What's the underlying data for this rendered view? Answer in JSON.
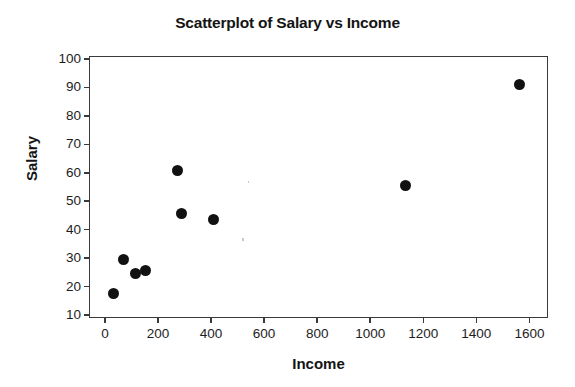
{
  "chart_data": {
    "type": "scatter",
    "title": "Scatterplot of Salary vs Income",
    "xlabel": "Income",
    "ylabel": "Salary",
    "xlim": [
      -60,
      1670
    ],
    "ylim": [
      9,
      101
    ],
    "xticks": [
      0,
      200,
      400,
      600,
      800,
      1000,
      1200,
      1400,
      1600
    ],
    "xtick_labels": [
      "0",
      "200",
      "400",
      "600",
      "800",
      "1000",
      "1200",
      "1400",
      "1600"
    ],
    "yticks": [
      10,
      20,
      30,
      40,
      50,
      60,
      70,
      80,
      90,
      100
    ],
    "ytick_labels": [
      "10",
      "20",
      "30",
      "40",
      "50",
      "60",
      "70",
      "80",
      "90",
      "100"
    ],
    "grid": false,
    "legend": false,
    "marker": {
      "shape": "circle",
      "color": "#111111",
      "size_px": 11
    },
    "series": [
      {
        "name": "Salary vs Income",
        "points": [
          {
            "x": 30,
            "y": 18.0
          },
          {
            "x": 65,
            "y": 30.0
          },
          {
            "x": 110,
            "y": 25.0
          },
          {
            "x": 150,
            "y": 26.0
          },
          {
            "x": 268,
            "y": 61.0
          },
          {
            "x": 283,
            "y": 46.0
          },
          {
            "x": 405,
            "y": 44.0
          },
          {
            "x": 1130,
            "y": 56.0
          },
          {
            "x": 1560,
            "y": 91.5
          }
        ]
      }
    ]
  },
  "axes": {
    "frame_color": "#3a3a3a",
    "background": "#ffffff"
  }
}
